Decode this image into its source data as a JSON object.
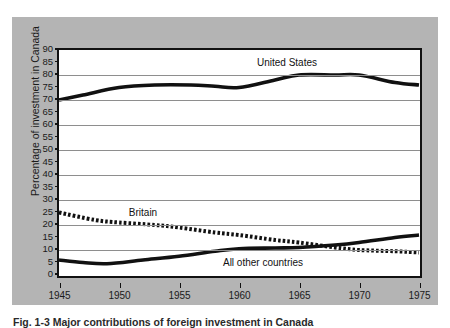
{
  "figure": {
    "caption": "Fig. 1-3  Major contributions of foreign investment in Canada",
    "panel_color": "#b4b4b4",
    "plot_background": "#ffffff",
    "axis_color": "#111111",
    "grid_color": "#8e8e8e"
  },
  "chart_data": {
    "type": "line",
    "title": "",
    "xlabel": "",
    "ylabel": "Percentage of investment in Canada",
    "xlim": [
      1945,
      1975
    ],
    "ylim": [
      0,
      90
    ],
    "grid": "horizontal-every-10",
    "legend": "inline-annotations",
    "x_ticks": [
      1945,
      1950,
      1955,
      1960,
      1965,
      1970,
      1975
    ],
    "y_ticks": [
      0,
      5,
      10,
      15,
      20,
      25,
      30,
      35,
      40,
      45,
      50,
      55,
      60,
      65,
      70,
      75,
      80,
      85,
      90
    ],
    "y_gridlines": [
      10,
      20,
      30,
      40,
      50,
      60,
      70,
      80,
      90
    ],
    "x": [
      1945,
      1950,
      1955,
      1960,
      1965,
      1970,
      1975
    ],
    "series": [
      {
        "name": "United States",
        "style": "solid-thick",
        "color": "#111111",
        "label_x": 1964,
        "label_y": 85,
        "values": [
          70,
          75,
          76,
          75,
          80,
          80,
          76
        ],
        "points": [
          {
            "x": 1945,
            "y": 70
          },
          {
            "x": 1947,
            "y": 72
          },
          {
            "x": 1950,
            "y": 75
          },
          {
            "x": 1953,
            "y": 76
          },
          {
            "x": 1956,
            "y": 76
          },
          {
            "x": 1958,
            "y": 75.5
          },
          {
            "x": 1960,
            "y": 75
          },
          {
            "x": 1963,
            "y": 78
          },
          {
            "x": 1965,
            "y": 80
          },
          {
            "x": 1968,
            "y": 80
          },
          {
            "x": 1970,
            "y": 80
          },
          {
            "x": 1973,
            "y": 77
          },
          {
            "x": 1975,
            "y": 76
          }
        ]
      },
      {
        "name": "Britain",
        "style": "dotted-thick",
        "color": "#111111",
        "label_x": 1952,
        "label_y": 25,
        "values": [
          25,
          21,
          19,
          16,
          13,
          10,
          9
        ],
        "points": [
          {
            "x": 1945,
            "y": 25
          },
          {
            "x": 1948,
            "y": 22
          },
          {
            "x": 1950,
            "y": 21
          },
          {
            "x": 1953,
            "y": 20
          },
          {
            "x": 1955,
            "y": 19
          },
          {
            "x": 1958,
            "y": 17
          },
          {
            "x": 1960,
            "y": 16
          },
          {
            "x": 1963,
            "y": 14
          },
          {
            "x": 1965,
            "y": 13
          },
          {
            "x": 1968,
            "y": 11
          },
          {
            "x": 1970,
            "y": 10
          },
          {
            "x": 1973,
            "y": 9.5
          },
          {
            "x": 1975,
            "y": 9
          }
        ]
      },
      {
        "name": "All other countries",
        "style": "solid-thick",
        "color": "#111111",
        "label_x": 1962,
        "label_y": 5,
        "values": [
          6,
          5,
          7,
          10,
          11,
          12,
          16
        ],
        "points": [
          {
            "x": 1945,
            "y": 6
          },
          {
            "x": 1947,
            "y": 5
          },
          {
            "x": 1949,
            "y": 4.5
          },
          {
            "x": 1952,
            "y": 6
          },
          {
            "x": 1955,
            "y": 7.5
          },
          {
            "x": 1958,
            "y": 9.5
          },
          {
            "x": 1960,
            "y": 10.5
          },
          {
            "x": 1963,
            "y": 10.8
          },
          {
            "x": 1965,
            "y": 11
          },
          {
            "x": 1968,
            "y": 12
          },
          {
            "x": 1970,
            "y": 13
          },
          {
            "x": 1973,
            "y": 15
          },
          {
            "x": 1975,
            "y": 16
          }
        ]
      }
    ]
  }
}
